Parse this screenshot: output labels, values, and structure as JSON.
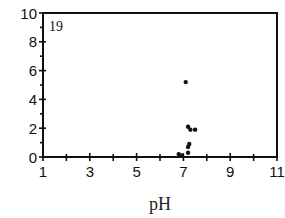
{
  "chart_data": {
    "type": "scatter",
    "title": "",
    "panel_label": "19",
    "xlabel": "pH",
    "ylabel": "",
    "xlim": [
      1,
      11
    ],
    "ylim": [
      0,
      10
    ],
    "x_ticks": [
      1,
      3,
      5,
      7,
      9,
      11
    ],
    "y_ticks": [
      0,
      2,
      4,
      6,
      8,
      10
    ],
    "grid": false,
    "legend": null,
    "series": [
      {
        "name": "samples",
        "points": [
          {
            "x": 7.1,
            "y": 5.2
          },
          {
            "x": 7.2,
            "y": 2.1
          },
          {
            "x": 7.3,
            "y": 1.9
          },
          {
            "x": 7.5,
            "y": 1.9
          },
          {
            "x": 7.25,
            "y": 0.9
          },
          {
            "x": 7.2,
            "y": 0.7
          },
          {
            "x": 7.2,
            "y": 0.3
          },
          {
            "x": 6.8,
            "y": 0.2
          },
          {
            "x": 6.9,
            "y": 0.1
          }
        ]
      }
    ],
    "colors": {
      "marker": "#111111",
      "axis": "#111111"
    }
  }
}
